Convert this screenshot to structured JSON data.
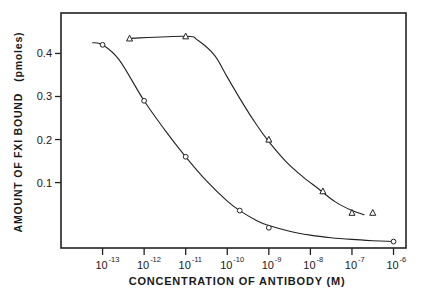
{
  "chart_data": {
    "type": "scatter",
    "title": "",
    "xlabel": "CONCENTRATION OF ANTIBODY (M)",
    "ylabel": "AMOUNT OF FXI BOUND (pmoles)",
    "xscale": "log",
    "x_tick_labels": [
      {
        "base": "10",
        "exp": "-13",
        "log": -13
      },
      {
        "base": "10",
        "exp": "-12",
        "log": -12
      },
      {
        "base": "10",
        "exp": "-11",
        "log": -11
      },
      {
        "base": "10",
        "exp": "-10",
        "log": -10
      },
      {
        "base": "10",
        "exp": "-9",
        "log": -9
      },
      {
        "base": "10",
        "exp": "-8",
        "log": -8
      },
      {
        "base": "10",
        "exp": "-7",
        "log": -7
      },
      {
        "base": "10",
        "exp": "-6",
        "log": -6
      }
    ],
    "y_ticks": [
      {
        "label": "0.1",
        "value": 0.1
      },
      {
        "label": "0.2",
        "value": 0.2
      },
      {
        "label": "0.3",
        "value": 0.3
      },
      {
        "label": "0.4",
        "value": 0.4
      }
    ],
    "xlim_log": [
      -14.0,
      -5.7
    ],
    "ylim": [
      -0.052,
      0.494
    ],
    "grid": false,
    "legend": "none",
    "series": [
      {
        "name": "circles",
        "marker": "circle",
        "x_log": [
          -13.0,
          -12.0,
          -11.0,
          -9.7,
          -9.0,
          -6.0
        ],
        "values": [
          0.42,
          0.29,
          0.16,
          0.035,
          -0.005,
          -0.037
        ],
        "curve_log_x": [
          -13.25,
          -13.0,
          -12.6,
          -12.0,
          -11.5,
          -11.0,
          -10.5,
          -10.0,
          -9.7,
          -9.3,
          -9.0,
          -8.5,
          -8.0,
          -7.5,
          -7.0,
          -6.5,
          -6.0
        ],
        "curve_y": [
          0.425,
          0.42,
          0.385,
          0.29,
          0.222,
          0.16,
          0.104,
          0.057,
          0.035,
          0.012,
          0.0,
          -0.013,
          -0.022,
          -0.028,
          -0.032,
          -0.035,
          -0.037
        ]
      },
      {
        "name": "triangles",
        "marker": "triangle",
        "x_log": [
          -12.35,
          -11.0,
          -9.0,
          -7.7,
          -7.0,
          -6.5
        ],
        "values": [
          0.435,
          0.44,
          0.2,
          0.08,
          0.03,
          0.03
        ],
        "curve_log_x": [
          -12.35,
          -11.0,
          -10.7,
          -10.3,
          -10.0,
          -9.6,
          -9.3,
          -9.0,
          -8.6,
          -8.2,
          -7.8,
          -7.4,
          -7.0,
          -6.7
        ],
        "curve_y": [
          0.435,
          0.44,
          0.43,
          0.395,
          0.345,
          0.28,
          0.235,
          0.195,
          0.15,
          0.115,
          0.085,
          0.055,
          0.035,
          0.025
        ]
      }
    ]
  },
  "axes": {
    "xlabel": "CONCENTRATION OF ANTIBODY (M)",
    "ylabel": "AMOUNT OF FXI BOUND   (pmoles)"
  }
}
